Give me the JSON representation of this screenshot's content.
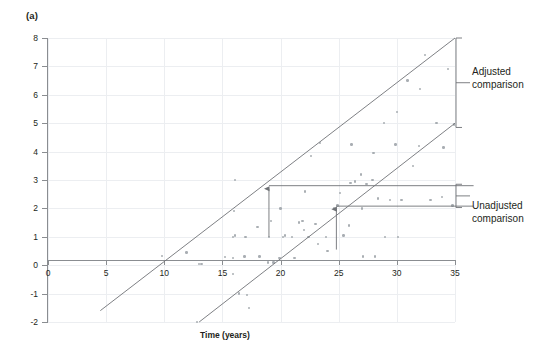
{
  "panel": {
    "label": "(a)"
  },
  "annotations": {
    "adjusted": "Adjusted\ncomparison",
    "adjusted_line1": "Adjusted",
    "adjusted_line2": "comparison",
    "unadjusted_line1": "Unadjusted",
    "unadjusted_line2": "comparison"
  },
  "colors": {
    "point": "#9aa0a6",
    "line": "#6f7276",
    "axis": "#8a8d91",
    "grid": "#eceef1",
    "text": "#231f20"
  },
  "chart_data": {
    "type": "scatter",
    "title": "",
    "xlabel": "Time (years)",
    "ylabel": "Measure",
    "xlim": [
      0,
      35
    ],
    "ylim": [
      -2,
      8
    ],
    "xticks": [
      0,
      5,
      10,
      15,
      20,
      25,
      30,
      35
    ],
    "yticks": [
      -2,
      -1,
      0,
      1,
      2,
      3,
      4,
      5,
      6,
      7,
      8
    ],
    "grid": true,
    "legend": "none",
    "series": [
      {
        "name": "observations",
        "marker": "dot",
        "points": [
          [
            9.8,
            0.32
          ],
          [
            11.9,
            0.45
          ],
          [
            12.8,
            -2.0
          ],
          [
            13.0,
            0.05
          ],
          [
            15.2,
            0.28
          ],
          [
            15.9,
            0.25
          ],
          [
            15.9,
            1.0
          ],
          [
            15.9,
            -0.3
          ],
          [
            16.1,
            1.05
          ],
          [
            16.4,
            -1.0
          ],
          [
            16.0,
            1.9
          ],
          [
            16.1,
            3.0
          ],
          [
            16.9,
            0.3
          ],
          [
            17.0,
            1.0
          ],
          [
            17.1,
            -1.05
          ],
          [
            17.3,
            -1.5
          ],
          [
            18.0,
            1.35
          ],
          [
            18.2,
            0.3
          ],
          [
            18.9,
            0.1
          ],
          [
            19.0,
            1.0
          ],
          [
            19.2,
            1.55
          ],
          [
            19.9,
            0.25
          ],
          [
            20.0,
            2.0
          ],
          [
            20.2,
            1.0
          ],
          [
            20.4,
            1.05
          ],
          [
            21.0,
            1.0
          ],
          [
            21.6,
            1.5
          ],
          [
            21.9,
            1.55
          ],
          [
            22.0,
            1.25
          ],
          [
            22.1,
            2.6
          ],
          [
            22.4,
            1.0
          ],
          [
            22.6,
            3.85
          ],
          [
            23.0,
            1.45
          ],
          [
            23.2,
            0.75
          ],
          [
            23.4,
            4.3
          ],
          [
            23.9,
            1.0
          ],
          [
            24.0,
            0.5
          ],
          [
            24.6,
            2.0
          ],
          [
            24.9,
            2.1
          ],
          [
            25.1,
            2.55
          ],
          [
            25.4,
            1.05
          ],
          [
            25.9,
            1.4
          ],
          [
            26.0,
            2.9
          ],
          [
            26.1,
            4.25
          ],
          [
            26.4,
            2.95
          ],
          [
            26.9,
            3.2
          ],
          [
            27.0,
            2.0
          ],
          [
            27.4,
            2.85
          ],
          [
            27.9,
            3.0
          ],
          [
            28.0,
            3.95
          ],
          [
            28.4,
            2.35
          ],
          [
            28.9,
            5.0
          ],
          [
            29.4,
            2.3
          ],
          [
            29.9,
            4.25
          ],
          [
            30.0,
            5.4
          ],
          [
            30.4,
            2.3
          ],
          [
            30.9,
            6.5
          ],
          [
            31.4,
            3.5
          ],
          [
            31.9,
            4.2
          ],
          [
            32.0,
            6.2
          ],
          [
            32.4,
            7.4
          ],
          [
            32.9,
            2.3
          ],
          [
            33.4,
            5.0
          ],
          [
            33.9,
            2.4
          ],
          [
            34.0,
            4.15
          ],
          [
            34.4,
            6.9
          ],
          [
            34.8,
            2.1
          ],
          [
            34.9,
            4.95
          ],
          [
            29.0,
            1.0
          ],
          [
            30.1,
            1.0
          ],
          [
            27.1,
            0.3
          ],
          [
            28.1,
            0.3
          ],
          [
            24.1,
            0.5
          ],
          [
            21.2,
            0.25
          ],
          [
            19.4,
            0.1
          ],
          [
            13.2,
            0.05
          ]
        ]
      }
    ],
    "fit_lines": [
      {
        "name": "upper-trend",
        "x0": 4.5,
        "y0": -1.6,
        "x1": 35.0,
        "y1": 8.0
      },
      {
        "name": "lower-trend",
        "x0": 13.0,
        "y0": -2.0,
        "x1": 35.0,
        "y1": 5.0
      }
    ],
    "arrows": [
      {
        "name": "adjusted-difference-arrow",
        "x": 19.0,
        "y_from": 1.0,
        "y_to": 2.8
      },
      {
        "name": "unadjusted-difference-arrow",
        "x": 24.8,
        "y_from": 0.55,
        "y_to": 2.08
      }
    ],
    "reference_lines": [
      {
        "name": "adjusted-upper-reference",
        "y": 2.8,
        "x0": 19.0,
        "x1": 36.6
      },
      {
        "name": "unadjusted-lower-reference",
        "y": 2.08,
        "x0": 24.8,
        "x1": 36.6
      }
    ]
  }
}
